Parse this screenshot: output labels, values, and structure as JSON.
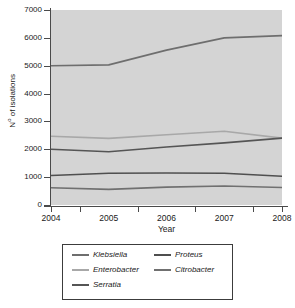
{
  "chart_data": {
    "type": "line",
    "title": "",
    "xlabel": "Year",
    "ylabel": "Nº of isolations",
    "categories": [
      "2004",
      "2005",
      "2006",
      "2007",
      "2008"
    ],
    "ylim": [
      0,
      7000
    ],
    "yticks": [
      0,
      1000,
      2000,
      3000,
      4000,
      5000,
      6000,
      7000
    ],
    "ytick_labels": [
      "0",
      "1000",
      "2000",
      "3000",
      "4000",
      "5000",
      "6000",
      "7000"
    ],
    "grid": false,
    "legend_position": "below",
    "plot_background": "#d4d4d4",
    "series": [
      {
        "name": "Klebsiella",
        "color": "#6e6e6e",
        "values": [
          5000,
          5030,
          5560,
          6000,
          6080
        ]
      },
      {
        "name": "Enterobacter",
        "color": "#a8a8a8",
        "values": [
          2470,
          2390,
          2520,
          2650,
          2400
        ]
      },
      {
        "name": "Serratia",
        "color": "#555555",
        "values": [
          2000,
          1910,
          2080,
          2230,
          2400
        ]
      },
      {
        "name": "Proteus",
        "color": "#4f4f4f",
        "values": [
          1060,
          1140,
          1150,
          1140,
          1030
        ]
      },
      {
        "name": "Citrobacter",
        "color": "#707070",
        "values": [
          620,
          560,
          640,
          680,
          630
        ]
      }
    ]
  },
  "legend": {
    "entries": [
      {
        "label": "Klebsiella",
        "color": "#6e6e6e"
      },
      {
        "label": "Proteus",
        "color": "#4f4f4f"
      },
      {
        "label": "Enterobacter",
        "color": "#a8a8a8"
      },
      {
        "label": "Citrobacter",
        "color": "#707070"
      },
      {
        "label": "Serratia",
        "color": "#555555"
      }
    ]
  }
}
